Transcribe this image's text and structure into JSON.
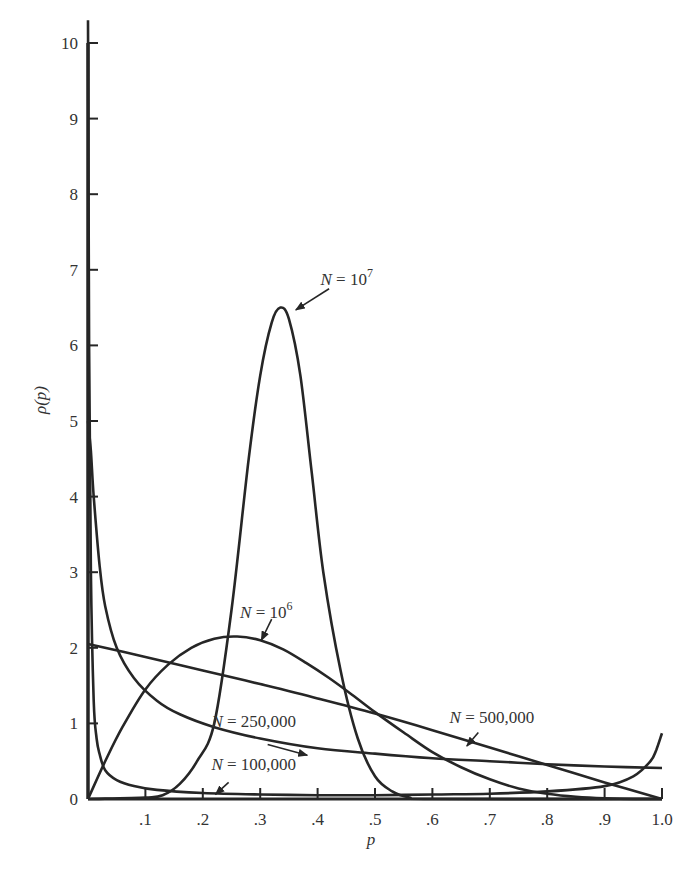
{
  "chart_data": {
    "type": "line",
    "title": "",
    "xlabel": "p",
    "ylabel": "ρ(p)",
    "xlim": [
      0,
      1.0
    ],
    "ylim": [
      0,
      10
    ],
    "grid": false,
    "legend": "inline labels with arrows",
    "x_ticks": [
      ".1",
      ".2",
      ".3",
      ".4",
      ".5",
      ".6",
      ".7",
      ".8",
      ".9",
      "1.0"
    ],
    "y_ticks": [
      "0",
      "1",
      "2",
      "3",
      "4",
      "5",
      "6",
      "7",
      "8",
      "9",
      "10"
    ],
    "series": [
      {
        "name": "N = 10^7",
        "label_text": "N = 10",
        "label_sup": "7",
        "x": [
          0.0,
          0.1,
          0.13,
          0.16,
          0.19,
          0.22,
          0.25,
          0.28,
          0.3,
          0.32,
          0.335,
          0.35,
          0.37,
          0.39,
          0.41,
          0.44,
          0.47,
          0.5,
          0.53,
          0.56,
          0.6,
          1.0
        ],
        "y": [
          0.0,
          0.02,
          0.05,
          0.2,
          0.5,
          1.0,
          2.5,
          4.5,
          5.6,
          6.3,
          6.5,
          6.35,
          5.6,
          4.3,
          3.0,
          1.7,
          0.8,
          0.3,
          0.1,
          0.02,
          0.0,
          0.0
        ]
      },
      {
        "name": "N = 10^6",
        "label_text": "N = 10",
        "label_sup": "6",
        "x": [
          0.0,
          0.03,
          0.06,
          0.1,
          0.14,
          0.18,
          0.22,
          0.26,
          0.3,
          0.34,
          0.38,
          0.42,
          0.46,
          0.5,
          0.55,
          0.6,
          0.65,
          0.7,
          0.75,
          0.8,
          0.85,
          0.9,
          0.95,
          1.0
        ],
        "y": [
          0.0,
          0.5,
          0.95,
          1.45,
          1.78,
          2.0,
          2.12,
          2.15,
          2.1,
          1.98,
          1.8,
          1.6,
          1.38,
          1.15,
          0.88,
          0.62,
          0.42,
          0.26,
          0.14,
          0.07,
          0.03,
          0.01,
          0.0,
          0.0
        ]
      },
      {
        "name": "N = 500,000",
        "label_text": "N = 500,000",
        "x": [
          0.0,
          0.1,
          0.2,
          0.3,
          0.4,
          0.5,
          0.6,
          0.7,
          0.8,
          0.9,
          1.0
        ],
        "y": [
          2.05,
          1.88,
          1.7,
          1.52,
          1.33,
          1.13,
          0.91,
          0.68,
          0.45,
          0.22,
          0.0
        ]
      },
      {
        "name": "N = 250,000",
        "label_text": "N = 250,000",
        "x": [
          0.0,
          0.005,
          0.01,
          0.02,
          0.03,
          0.05,
          0.08,
          0.12,
          0.16,
          0.22,
          0.3,
          0.4,
          0.5,
          0.6,
          0.7,
          0.8,
          0.9,
          1.0
        ],
        "y": [
          5.0,
          4.6,
          4.0,
          3.1,
          2.55,
          2.0,
          1.6,
          1.3,
          1.12,
          0.95,
          0.8,
          0.67,
          0.6,
          0.54,
          0.5,
          0.46,
          0.43,
          0.41
        ]
      },
      {
        "name": "N = 100,000",
        "label_text": "N = 100,000",
        "x": [
          0.0,
          0.002,
          0.005,
          0.01,
          0.015,
          0.02,
          0.03,
          0.05,
          0.08,
          0.12,
          0.2,
          0.3,
          0.4,
          0.5,
          0.6,
          0.7,
          0.8,
          0.9,
          0.95,
          0.98,
          0.99,
          1.0
        ],
        "y": [
          10.3,
          6.0,
          3.0,
          1.3,
          0.8,
          0.6,
          0.38,
          0.25,
          0.17,
          0.12,
          0.08,
          0.06,
          0.05,
          0.05,
          0.06,
          0.07,
          0.1,
          0.17,
          0.3,
          0.5,
          0.65,
          0.87
        ]
      }
    ],
    "annotations": [
      {
        "series": "N = 10^7",
        "text_pos": [
          0.405,
          6.8
        ],
        "arrow_from": [
          0.42,
          6.75
        ],
        "arrow_to": [
          0.362,
          6.47
        ]
      },
      {
        "series": "N = 10^6",
        "text_pos": [
          0.265,
          2.4
        ],
        "arrow_from": [
          0.32,
          2.38
        ],
        "arrow_to": [
          0.302,
          2.1
        ]
      },
      {
        "series": "N = 500,000",
        "text_pos": [
          0.63,
          1.0
        ],
        "arrow_from": [
          0.68,
          0.88
        ],
        "arrow_to": [
          0.66,
          0.7
        ]
      },
      {
        "series": "N = 250,000",
        "text_pos": [
          0.215,
          0.95
        ],
        "arrow_from": [
          0.313,
          0.72
        ],
        "arrow_to": [
          0.382,
          0.58
        ]
      },
      {
        "series": "N = 100,000",
        "text_pos": [
          0.215,
          0.38
        ],
        "arrow_from": [
          0.245,
          0.22
        ],
        "arrow_to": [
          0.222,
          0.06
        ]
      }
    ]
  }
}
